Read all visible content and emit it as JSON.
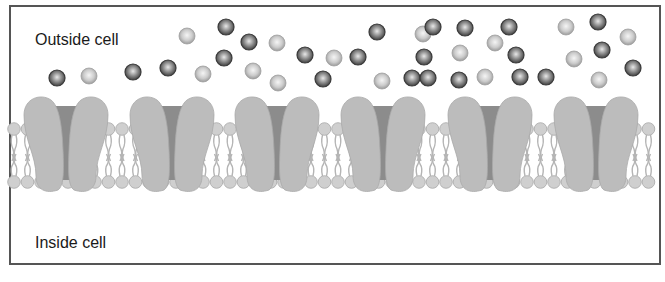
{
  "diagram": {
    "labels": {
      "outside": "Outside cell",
      "inside": "Inside cell"
    },
    "colors": {
      "border": "#555555",
      "channel": "#bcbcbc",
      "channel_pore": "#8c8c8c",
      "lipid_head": "#cfcfcf",
      "lipid_tail": "#b5b5b5",
      "ball_dark": "#5a5a5a",
      "ball_light": "#bdbdbd"
    },
    "channels": [
      {
        "cx": 66
      },
      {
        "cx": 172
      },
      {
        "cx": 277
      },
      {
        "cx": 383
      },
      {
        "cx": 490
      },
      {
        "cx": 596
      }
    ],
    "particles": [
      {
        "x": 57,
        "y": 78,
        "type": "dark"
      },
      {
        "x": 89,
        "y": 76,
        "type": "light"
      },
      {
        "x": 133,
        "y": 72,
        "type": "dark"
      },
      {
        "x": 168,
        "y": 68,
        "type": "dark"
      },
      {
        "x": 203,
        "y": 74,
        "type": "light"
      },
      {
        "x": 187,
        "y": 36,
        "type": "light"
      },
      {
        "x": 226,
        "y": 27,
        "type": "dark"
      },
      {
        "x": 249,
        "y": 42,
        "type": "dark"
      },
      {
        "x": 277,
        "y": 43,
        "type": "light"
      },
      {
        "x": 224,
        "y": 58,
        "type": "dark"
      },
      {
        "x": 253,
        "y": 71,
        "type": "light"
      },
      {
        "x": 278,
        "y": 83,
        "type": "light"
      },
      {
        "x": 305,
        "y": 55,
        "type": "dark"
      },
      {
        "x": 334,
        "y": 58,
        "type": "light"
      },
      {
        "x": 358,
        "y": 57,
        "type": "dark"
      },
      {
        "x": 323,
        "y": 79,
        "type": "dark"
      },
      {
        "x": 377,
        "y": 32,
        "type": "dark"
      },
      {
        "x": 382,
        "y": 81,
        "type": "light"
      },
      {
        "x": 412,
        "y": 78,
        "type": "dark"
      },
      {
        "x": 423,
        "y": 34,
        "type": "light"
      },
      {
        "x": 433,
        "y": 27,
        "type": "dark"
      },
      {
        "x": 424,
        "y": 57,
        "type": "dark"
      },
      {
        "x": 428,
        "y": 78,
        "type": "dark"
      },
      {
        "x": 465,
        "y": 28,
        "type": "dark"
      },
      {
        "x": 460,
        "y": 53,
        "type": "light"
      },
      {
        "x": 459,
        "y": 80,
        "type": "dark"
      },
      {
        "x": 495,
        "y": 43,
        "type": "light"
      },
      {
        "x": 509,
        "y": 27,
        "type": "dark"
      },
      {
        "x": 516,
        "y": 55,
        "type": "dark"
      },
      {
        "x": 485,
        "y": 77,
        "type": "light"
      },
      {
        "x": 520,
        "y": 77,
        "type": "dark"
      },
      {
        "x": 546,
        "y": 77,
        "type": "dark"
      },
      {
        "x": 566,
        "y": 27,
        "type": "light"
      },
      {
        "x": 598,
        "y": 22,
        "type": "dark"
      },
      {
        "x": 574,
        "y": 59,
        "type": "light"
      },
      {
        "x": 602,
        "y": 50,
        "type": "dark"
      },
      {
        "x": 599,
        "y": 80,
        "type": "light"
      },
      {
        "x": 628,
        "y": 37,
        "type": "light"
      },
      {
        "x": 633,
        "y": 68,
        "type": "dark"
      }
    ]
  }
}
